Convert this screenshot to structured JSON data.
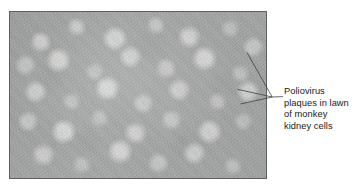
{
  "figure": {
    "kind": "scientific-micrograph-figure",
    "background_color": "#ffffff"
  },
  "photo": {
    "name": "poliovirus-plaque-assay-photograph",
    "subject": "Plaque assay plate showing poliovirus plaques in a lawn of monkey kidney cells",
    "border_color": "#5d5f61",
    "base_gray": "#a7a9a8",
    "plaque_highlight": "#e5e6e4",
    "alt_text": "Grayscale photograph of a confluent monkey kidney cell lawn with numerous lighter, roughly circular poliovirus plaques scattered across the surface"
  },
  "callout": {
    "name": "plaque-callout",
    "pointer_color": "#3a3a3a",
    "text_color": "#1a1a1a",
    "label_full": "Poliovirus plaques in lawn of monkey kidney cells",
    "lines": [
      "Poliovirus",
      "plaques in lawn",
      "of monkey",
      "kidney cells"
    ]
  }
}
